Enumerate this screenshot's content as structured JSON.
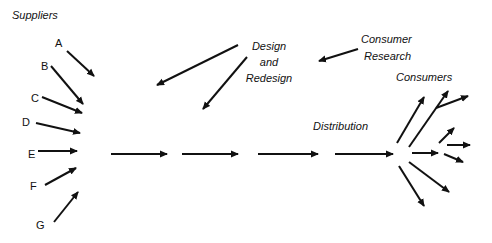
{
  "labels": {
    "suppliers": "Suppliers",
    "supplier_letters": [
      "A",
      "B",
      "C",
      "D",
      "E",
      "F",
      "G"
    ],
    "design_line1": "Design",
    "design_line2": "and",
    "design_line3": "Redesign",
    "research_line1": "Consumer",
    "research_line2": "Research",
    "consumers": "Consumers",
    "distribution": "Distribution"
  },
  "colors": {
    "stroke": "#111111",
    "background": "#ffffff"
  },
  "arrows": {
    "suppliers": [
      {
        "id": "A",
        "x1": 67,
        "y1": 51,
        "x2": 94,
        "y2": 76
      },
      {
        "id": "B",
        "x1": 51,
        "y1": 66,
        "x2": 83,
        "y2": 104
      },
      {
        "id": "C",
        "x1": 42,
        "y1": 97,
        "x2": 82,
        "y2": 113
      },
      {
        "id": "D",
        "x1": 36,
        "y1": 123,
        "x2": 80,
        "y2": 133
      },
      {
        "id": "E",
        "x1": 38,
        "y1": 151,
        "x2": 77,
        "y2": 151
      },
      {
        "id": "F",
        "x1": 45,
        "y1": 185,
        "x2": 76,
        "y2": 168
      },
      {
        "id": "G",
        "x1": 54,
        "y1": 222,
        "x2": 78,
        "y2": 192
      }
    ],
    "flow": [
      {
        "x1": 111,
        "y1": 154,
        "x2": 167,
        "y2": 154
      },
      {
        "x1": 182,
        "y1": 154,
        "x2": 238,
        "y2": 154
      },
      {
        "x1": 258,
        "y1": 154,
        "x2": 318,
        "y2": 154
      },
      {
        "x1": 335,
        "y1": 154,
        "x2": 393,
        "y2": 154
      }
    ],
    "design": [
      {
        "x1": 238,
        "y1": 45,
        "x2": 157,
        "y2": 85
      },
      {
        "x1": 247,
        "y1": 57,
        "x2": 203,
        "y2": 109
      }
    ],
    "research": [
      {
        "x1": 358,
        "y1": 49,
        "x2": 319,
        "y2": 61
      }
    ],
    "consumers": [
      {
        "x1": 397,
        "y1": 143,
        "x2": 424,
        "y2": 97
      },
      {
        "x1": 409,
        "y1": 147,
        "x2": 448,
        "y2": 91
      },
      {
        "x1": 436,
        "y1": 108,
        "x2": 468,
        "y2": 96
      },
      {
        "x1": 412,
        "y1": 153,
        "x2": 438,
        "y2": 153
      },
      {
        "x1": 439,
        "y1": 143,
        "x2": 454,
        "y2": 128
      },
      {
        "x1": 447,
        "y1": 145,
        "x2": 470,
        "y2": 145
      },
      {
        "x1": 444,
        "y1": 154,
        "x2": 463,
        "y2": 162
      },
      {
        "x1": 409,
        "y1": 162,
        "x2": 449,
        "y2": 192
      },
      {
        "x1": 399,
        "y1": 166,
        "x2": 424,
        "y2": 206
      }
    ]
  }
}
